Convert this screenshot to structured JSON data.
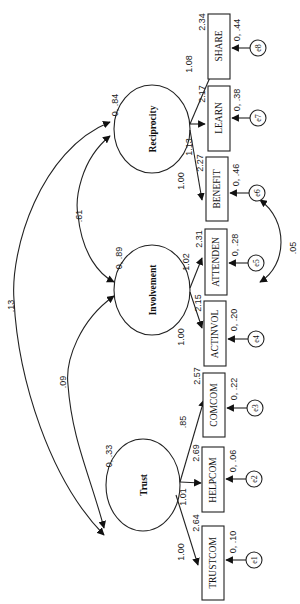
{
  "diagram": {
    "type": "structural-equation-model",
    "orientation": "rotated-90",
    "latent_factors": [
      {
        "id": "trust",
        "label": "Trust",
        "variance": "0, .33"
      },
      {
        "id": "involvement",
        "label": "Involvement",
        "variance": "0, .89"
      },
      {
        "id": "reciprocity",
        "label": "Reciprocity",
        "variance": "0, .84"
      }
    ],
    "indicators": [
      {
        "id": "trustcom",
        "label": "TRUSTCOM",
        "factor": "trust",
        "loading": "1.00",
        "intercept": "2.64",
        "error": "e1",
        "error_variance": "0, .10",
        "error_weight": "1"
      },
      {
        "id": "helpcom",
        "label": "HELPCOM",
        "factor": "trust",
        "loading": "1.01",
        "intercept": "2.69",
        "error": "e2",
        "error_variance": "0, .06",
        "error_weight": "1"
      },
      {
        "id": "comcom",
        "label": "COMCOM",
        "factor": "trust",
        "loading": ".85",
        "intercept": "2.57",
        "error": "e3",
        "error_variance": "0, .22",
        "error_weight": "1"
      },
      {
        "id": "actinvol",
        "label": "ACTINVOL",
        "factor": "involvement",
        "loading": "1.00",
        "intercept": "2.15",
        "error": "e4",
        "error_variance": "0, .20",
        "error_weight": "1"
      },
      {
        "id": "attenden",
        "label": "ATTENDEN",
        "factor": "involvement",
        "loading": "1.02",
        "intercept": "2.31",
        "error": "e5",
        "error_variance": "0, .28",
        "error_weight": "1"
      },
      {
        "id": "benefit",
        "label": "BENEFIT",
        "factor": "reciprocity",
        "loading": "1.00",
        "intercept": "2.27",
        "error": "e6",
        "error_variance": "0, .46",
        "error_weight": "1"
      },
      {
        "id": "learn",
        "label": "LEARN",
        "factor": "reciprocity",
        "loading": "1.13",
        "intercept": "2.17",
        "error": "e7",
        "error_variance": "0, .38",
        "error_weight": "1"
      },
      {
        "id": "share",
        "label": "SHARE",
        "factor": "reciprocity",
        "loading": "1.08",
        "intercept": "2.34",
        "error": "e8",
        "error_variance": "0, .44",
        "error_weight": "1"
      }
    ],
    "covariances": [
      {
        "between": [
          "trust",
          "reciprocity"
        ],
        "value": ".13"
      },
      {
        "between": [
          "involvement",
          "reciprocity"
        ],
        "value": ".61"
      },
      {
        "between": [
          "trust",
          "involvement"
        ],
        "value": ".09"
      },
      {
        "between": [
          "e5",
          "e6"
        ],
        "value": ".05"
      }
    ]
  }
}
